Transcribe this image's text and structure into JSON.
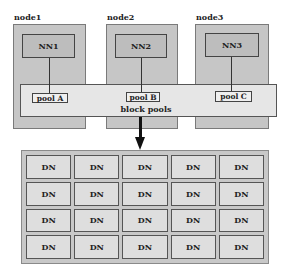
{
  "diagram": {
    "nodes": [
      {
        "label": "node1",
        "namenode": "NN1",
        "pool": "pool A"
      },
      {
        "label": "node2",
        "namenode": "NN2",
        "pool": "pool B"
      },
      {
        "label": "node3",
        "namenode": "NN3",
        "pool": "pool C"
      }
    ],
    "band_label": "block pools",
    "datanodes": {
      "rows": 4,
      "cols": 5,
      "cell_label": "DN",
      "cells": [
        [
          "DN",
          "DN",
          "DN",
          "DN",
          "DN"
        ],
        [
          "DN",
          "DN",
          "DN",
          "DN",
          "DN"
        ],
        [
          "DN",
          "DN",
          "DN",
          "DN",
          "DN"
        ],
        [
          "DN",
          "DN",
          "DN",
          "DN",
          "DN"
        ]
      ]
    },
    "colors": {
      "node_fill": "#c6c6c6",
      "band_fill": "#e6e6e6",
      "dn_fill": "#dedede",
      "line": "#333333"
    }
  }
}
